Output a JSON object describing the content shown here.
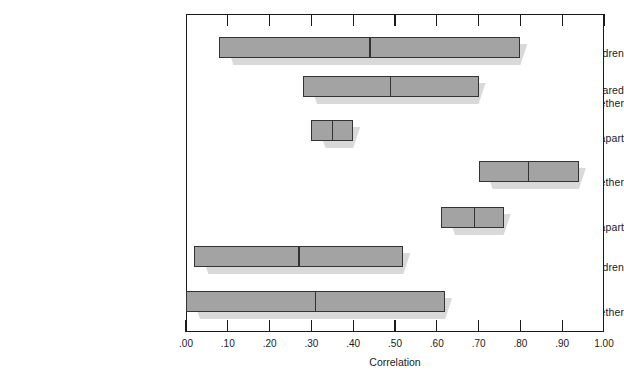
{
  "chart_data": {
    "type": "bar",
    "title": "",
    "xlabel": "Correlation",
    "ylabel": "",
    "xlim": [
      0.0,
      1.0
    ],
    "grid": false,
    "legend": "none",
    "orientation": "horizontal",
    "note": "Range bars with median marker; each bar spans a low-to-high correlation range",
    "xticks": [
      0.0,
      0.1,
      0.2,
      0.3,
      0.4,
      0.5,
      0.6,
      0.7,
      0.8,
      0.9,
      1.0
    ],
    "xticklabels": [
      ".00",
      ".10",
      ".20",
      ".30",
      ".40",
      ".50",
      ".60",
      ".70",
      ".80",
      ".90",
      "1.00"
    ],
    "categories": [
      "Parents and children",
      "Brothers and sisters, reared together",
      "Brothers and sisters, reared apart",
      "Identical twins, reared together",
      "Identical twins, reared apart",
      "Parents and adopted children",
      "Unrelated children, reared together"
    ],
    "bars": [
      {
        "label": "Parents and children",
        "low": 0.08,
        "high": 0.8,
        "median": 0.44
      },
      {
        "label": "Brothers and sisters, reared together",
        "low": 0.28,
        "high": 0.7,
        "median": 0.49
      },
      {
        "label": "Brothers and sisters, reared apart",
        "low": 0.3,
        "high": 0.4,
        "median": 0.35
      },
      {
        "label": "Identical twins, reared together",
        "low": 0.7,
        "high": 0.94,
        "median": 0.82
      },
      {
        "label": "Identical twins, reared apart",
        "low": 0.61,
        "high": 0.76,
        "median": 0.69
      },
      {
        "label": "Parents and adopted children",
        "low": 0.02,
        "high": 0.52,
        "median": 0.27
      },
      {
        "label": "Unrelated children, reared together",
        "low": 0.0,
        "high": 0.62,
        "median": 0.31
      }
    ]
  },
  "colors": {
    "bar_fill": "#a3a3a3",
    "bar_border": "#333333",
    "bar_shadow": "#d9d9d9",
    "frame": "#1a1a1a",
    "text": "#1a1a1a",
    "background": "#ffffff"
  },
  "labels": {
    "cat0": "Parents and children",
    "cat1": "Brothers and sisters, reared\ntogether",
    "cat2": "Brothers and sisters, reared apart",
    "cat3": "Identical twins, reared together",
    "cat4": "Identical twins, reared apart",
    "cat5": "Parents and adopted children",
    "cat6": "Unrelated children, reared together"
  },
  "axis": {
    "title": "Correlation",
    "tick0": ".00",
    "tick1": ".10",
    "tick2": ".20",
    "tick3": ".30",
    "tick4": ".40",
    "tick5": ".50",
    "tick6": ".60",
    "tick7": ".70",
    "tick8": ".80",
    "tick9": ".90",
    "tick10": "1.00"
  }
}
